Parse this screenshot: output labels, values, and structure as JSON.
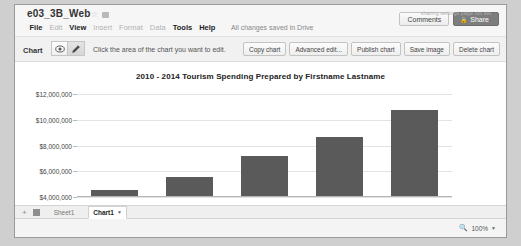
{
  "header": {
    "doc_title": "e03_3B_Web",
    "star_icon": "star-icon",
    "folder_icon": "folder-icon",
    "menus": [
      {
        "label": "File",
        "active": true
      },
      {
        "label": "Edit",
        "active": false
      },
      {
        "label": "View",
        "active": true
      },
      {
        "label": "Insert",
        "active": false
      },
      {
        "label": "Format",
        "active": false
      },
      {
        "label": "Data",
        "active": false
      },
      {
        "label": "Tools",
        "active": true
      },
      {
        "label": "Help",
        "active": true
      }
    ],
    "save_status": "All changes saved in Drive",
    "comments_label": "Comments",
    "share_label": "Share",
    "overflow_text": "sharing settings page not set"
  },
  "chart_toolbar": {
    "label": "Chart",
    "preview_icon": "eye-icon",
    "edit_icon": "pencil-icon",
    "hint": "Click the area of the chart you want to edit.",
    "actions": [
      "Copy chart",
      "Advanced edit...",
      "Publish chart",
      "Save image",
      "Delete chart"
    ]
  },
  "footer": {
    "add_sheet_icon": "plus-icon",
    "all_sheets_icon": "grid-icon",
    "tabs": [
      {
        "label": "Sheet1",
        "active": false
      },
      {
        "label": "Chart1",
        "active": true
      }
    ],
    "tab_caret": "caret-down-icon",
    "zoom_icon": "magnifier-icon",
    "zoom_level": "100%",
    "zoom_caret": "caret-down-icon"
  },
  "chart_data": {
    "type": "bar",
    "title": "2010 - 2014 Tourism Spending Prepared by Firstname Lastname",
    "xlabel": "",
    "ylabel": "",
    "categories": [
      "2010",
      "2011",
      "2012",
      "2013",
      "2014"
    ],
    "values": [
      4500000,
      5500000,
      7100000,
      8600000,
      10700000
    ],
    "ylim": [
      4000000,
      12000000
    ],
    "yticks": [
      4000000,
      6000000,
      8000000,
      10000000,
      12000000
    ],
    "ytick_labels": [
      "$4,000,000",
      "$6,000,000",
      "$8,000,000",
      "$10,000,000",
      "$12,000,000"
    ],
    "series": [
      {
        "name": "Tourism Spending",
        "values": [
          4500000,
          5500000,
          7100000,
          8600000,
          10700000
        ]
      }
    ],
    "bar_color": "#5a5a5a",
    "grid": true,
    "legend": false
  }
}
